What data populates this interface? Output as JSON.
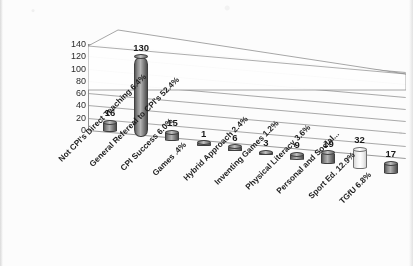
{
  "chart_data": {
    "type": "bar",
    "title": "",
    "subtitle": "",
    "xlabel": "",
    "ylabel": "",
    "ylim": [
      0,
      140
    ],
    "ytick_labels": [
      "140",
      "120",
      "100",
      "80",
      "60",
      "40",
      "20",
      "0"
    ],
    "ytick_values": [
      140,
      120,
      100,
      80,
      60,
      40,
      20,
      0
    ],
    "grid": true,
    "legend": "none",
    "style": "3d-cylinder",
    "categories": [
      "Not CPI's Direct Teaching 6.4%",
      "General Refereal to CPI's 52.4%",
      "CPI Success 6.0%",
      "Games .4%",
      "Hybrid Approach 2.4%",
      "Inventing Games 1.2%",
      "Physical Literacy 3.6%",
      "Personal and Social...",
      "Sport Ed. 12.9%",
      "TGfU 6.8%"
    ],
    "values": [
      16,
      130,
      15,
      1,
      6,
      3,
      9,
      19,
      32,
      17
    ],
    "value_labels": [
      "16",
      "130",
      "15",
      "1",
      "6",
      "3",
      "9",
      "19",
      "32",
      "17"
    ],
    "bar_styles": [
      "dark",
      "dark",
      "dark",
      "dark",
      "dark",
      "dark",
      "dark",
      "dark",
      "light",
      "dark"
    ],
    "colors": {
      "bar_dark": "#7d7d7d",
      "bar_light": "#ffffff",
      "bar_outline": "#3f3f3f",
      "gridline": "#9a9a9a",
      "text": "#1d1d1d",
      "background": "#fcfcfc"
    }
  }
}
